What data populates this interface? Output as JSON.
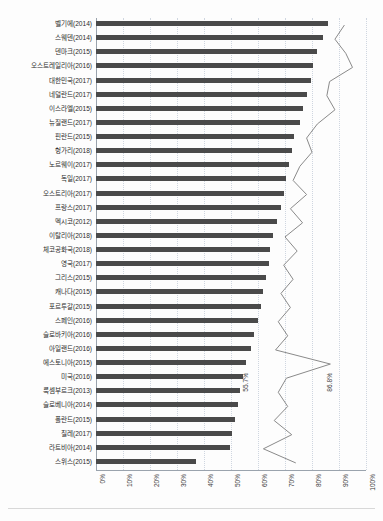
{
  "chart": {
    "title": "",
    "xlabel": "",
    "ylabel": ""
  },
  "annotations": [
    {
      "text": "55.7%",
      "x_pct": 55.7,
      "row_index": 24
    },
    {
      "text": "86.8%",
      "x_pct": 86.8,
      "row_index": 24
    }
  ],
  "chart_data": {
    "type": "bar",
    "title": "",
    "xlabel": "",
    "ylabel": "",
    "xlim": [
      0,
      100
    ],
    "grid": true,
    "orientation": "horizontal",
    "legend_position": "top",
    "tick_labels": [
      "0%",
      "10%",
      "20%",
      "30%",
      "40%",
      "50%",
      "60%",
      "70%",
      "80%",
      "90%",
      "100%"
    ],
    "tick_values": [
      0,
      10,
      20,
      30,
      40,
      50,
      60,
      70,
      80,
      90,
      100
    ],
    "categories": [
      "벨기에(2014)",
      "스웨덴(2014)",
      "덴마크(2015)",
      "오스트레일리아(2016)",
      "대한민국(2017)",
      "네덜란드(2017)",
      "이스라엘(2015)",
      "뉴질랜드(2017)",
      "핀란드(2015)",
      "헝가리(2018)",
      "노르웨이(2017)",
      "독일(2017)",
      "오스트리아(2017)",
      "프랑스(2017)",
      "멕시코(2012)",
      "이탈리아(2018)",
      "체코공화국(2018)",
      "영국(2017)",
      "그리스(2015)",
      "캐나다(2015)",
      "포르투갈(2015)",
      "스페인(2016)",
      "슬로바키아(2016)",
      "아일랜드(2016)",
      "에스토니아(2015)",
      "미국(2016)",
      "룩셈부르크(2013)",
      "슬로베니아(2014)",
      "폴란드(2015)",
      "칠레(2017)",
      "라트비아(2014)",
      "스위스(2015)"
    ],
    "series": [
      {
        "name": "bar-series",
        "type": "bar",
        "color": "#4a4a4a",
        "values": [
          86.0,
          84.0,
          82.0,
          80.5,
          79.5,
          78.0,
          76.5,
          75.5,
          73.5,
          72.5,
          71.5,
          70.5,
          69.5,
          68.5,
          67.0,
          65.5,
          64.5,
          64.0,
          63.0,
          62.0,
          61.0,
          60.0,
          58.5,
          57.5,
          55.7,
          54.5,
          53.5,
          52.5,
          51.5,
          50.5,
          49.5,
          37.0
        ]
      },
      {
        "name": "line-series",
        "type": "line",
        "color": "#8a8a8a",
        "values": [
          92.0,
          88.5,
          92.5,
          95.0,
          86.5,
          85.5,
          88.5,
          82.0,
          78.0,
          80.0,
          75.5,
          73.0,
          78.0,
          72.0,
          76.5,
          70.0,
          74.5,
          69.5,
          73.0,
          68.5,
          72.0,
          67.5,
          71.0,
          66.5,
          86.8,
          70.5,
          67.5,
          71.0,
          66.0,
          72.5,
          62.0,
          74.0
        ]
      }
    ]
  }
}
